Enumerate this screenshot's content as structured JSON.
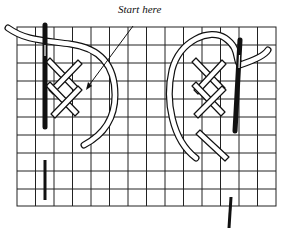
{
  "diagram": {
    "annotation": "Start here",
    "left_panel": {
      "description": "needle going down, cross stitches, start point arrow"
    },
    "right_panel": {
      "description": "needle coming up, thread looped over cross stitches"
    },
    "colors": {
      "ink": "#111111",
      "background": "#ffffff"
    }
  }
}
